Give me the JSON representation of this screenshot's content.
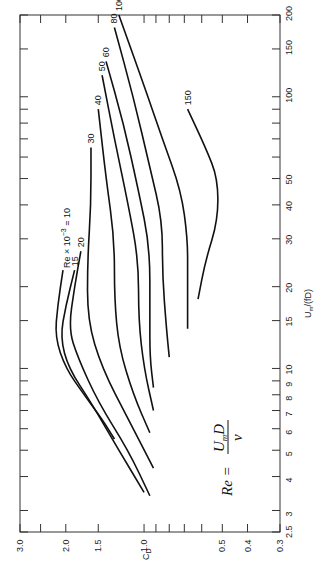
{
  "chart_data": {
    "type": "line",
    "title": "",
    "orientation": "rotated 90° (C_D axis along bottom, U_m/(fD) along right)",
    "xlabel": "C_D",
    "ylabel": "U_m/(fD)",
    "x_scale": "log",
    "y_scale": "log",
    "xlim": [
      3.0,
      0.3
    ],
    "ylim": [
      2.5,
      200
    ],
    "x_ticks": [
      "3.0",
      "2.0",
      "1.5",
      "1.0",
      "0.5",
      "0.4",
      "0.3"
    ],
    "y_ticks": [
      "2.5",
      "3",
      "4",
      "5",
      "6",
      "7",
      "8",
      "9",
      "10",
      "15",
      "20",
      "30",
      "40",
      "50",
      "100",
      "150",
      "200"
    ],
    "grid": false,
    "annotation": "Re = U_m D / ν",
    "legend_title": "Re × 10^-3",
    "series": [
      {
        "name": "10",
        "points": [
          [
            2.05,
            23
          ],
          [
            2.15,
            17
          ],
          [
            2.2,
            13
          ],
          [
            2.0,
            10
          ],
          [
            1.7,
            8
          ],
          [
            1.45,
            6.5
          ],
          [
            1.3,
            5.5
          ]
        ]
      },
      {
        "name": "15",
        "points": [
          [
            1.85,
            23
          ],
          [
            2.0,
            17
          ],
          [
            2.1,
            13
          ],
          [
            1.95,
            10
          ],
          [
            1.6,
            7.5
          ],
          [
            1.25,
            5
          ],
          [
            1.0,
            3.5
          ]
        ]
      },
      {
        "name": "20",
        "points": [
          [
            1.75,
            27
          ],
          [
            1.85,
            20
          ],
          [
            1.95,
            14
          ],
          [
            1.8,
            11
          ],
          [
            1.5,
            7.5
          ],
          [
            1.15,
            5
          ],
          [
            0.95,
            3.4
          ]
        ]
      },
      {
        "name": "30",
        "points": [
          [
            1.6,
            65
          ],
          [
            1.6,
            40
          ],
          [
            1.65,
            25
          ],
          [
            1.65,
            15
          ],
          [
            1.45,
            10
          ],
          [
            1.15,
            6.5
          ],
          [
            0.92,
            4.3
          ]
        ]
      },
      {
        "name": "40",
        "points": [
          [
            1.5,
            90
          ],
          [
            1.4,
            50
          ],
          [
            1.3,
            30
          ],
          [
            1.3,
            18
          ],
          [
            1.25,
            12
          ],
          [
            1.1,
            8
          ],
          [
            0.95,
            5.8
          ]
        ]
      },
      {
        "name": "50",
        "points": [
          [
            1.45,
            120
          ],
          [
            1.3,
            70
          ],
          [
            1.15,
            40
          ],
          [
            1.05,
            25
          ],
          [
            1.05,
            15
          ],
          [
            1.0,
            10
          ],
          [
            0.92,
            7
          ]
        ]
      },
      {
        "name": "60",
        "points": [
          [
            1.4,
            135
          ],
          [
            1.2,
            80
          ],
          [
            1.05,
            45
          ],
          [
            0.95,
            28
          ],
          [
            0.95,
            16
          ],
          [
            0.95,
            11
          ],
          [
            0.92,
            8.5
          ]
        ]
      },
      {
        "name": "80",
        "points": [
          [
            1.3,
            180
          ],
          [
            1.1,
            100
          ],
          [
            0.95,
            55
          ],
          [
            0.85,
            35
          ],
          [
            0.85,
            22
          ],
          [
            0.82,
            14
          ],
          [
            0.8,
            11
          ]
        ]
      },
      {
        "name": "100",
        "points": [
          [
            1.25,
            200
          ],
          [
            1.0,
            110
          ],
          [
            0.85,
            70
          ],
          [
            0.72,
            45
          ],
          [
            0.68,
            30
          ],
          [
            0.68,
            22
          ],
          [
            0.68,
            14
          ]
        ]
      },
      {
        "name": "150",
        "points": [
          [
            0.68,
            90
          ],
          [
            0.58,
            65
          ],
          [
            0.52,
            50
          ],
          [
            0.52,
            35
          ],
          [
            0.58,
            25
          ],
          [
            0.62,
            18
          ]
        ]
      }
    ]
  },
  "axes": {
    "x_label": "C",
    "x_label_sub": "D",
    "y_label_main": "U",
    "y_label_sub": "m",
    "y_label_tail": "/(fD)"
  },
  "annotations": {
    "re_label": "Re × 10",
    "re_exp": "−3",
    "re_eq": " = 10",
    "formula_lhs": "Re =",
    "formula_num": "U",
    "formula_num_sub": "m",
    "formula_num_tail": "D",
    "formula_den": "ν"
  }
}
